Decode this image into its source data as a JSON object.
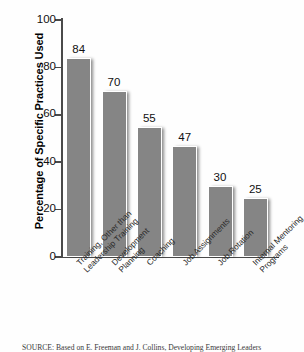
{
  "chart_data": {
    "type": "bar",
    "title": "",
    "xlabel": "",
    "ylabel": "Percentage of Specific Practices Used",
    "ylim": [
      0,
      100
    ],
    "yticks": [
      0,
      20,
      40,
      60,
      80,
      100
    ],
    "grid": false,
    "legend": "none",
    "categories": [
      "Training, Other than Leadership Training",
      "Development Planning",
      "Coaching",
      "Job Assignments",
      "Job Rotation",
      "Internal Mentoring Programs"
    ],
    "category_lines": [
      [
        "Training, Other than",
        "Leadership Training"
      ],
      [
        "Development",
        "Planning"
      ],
      [
        "Coaching"
      ],
      [
        "Job Assignments"
      ],
      [
        "Job Rotation"
      ],
      [
        "Internal Mentoring",
        "Programs"
      ]
    ],
    "values": [
      84,
      70,
      55,
      47,
      30,
      25
    ],
    "value_labels": [
      "84",
      "70",
      "55",
      "47",
      "30",
      "25"
    ],
    "bar_color": "#858585",
    "axis_color": "#4a4a4a"
  },
  "source": {
    "text": "SOURCE: Based on E. Freeman and J. Collins, Developing Emerging Leaders"
  }
}
